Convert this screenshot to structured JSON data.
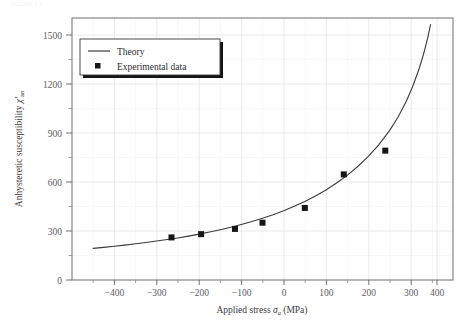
{
  "figure": {
    "caption": "FIGURE 1.1",
    "background": "#ffffff"
  },
  "chart_data": {
    "type": "line",
    "title": "",
    "xlabel": "Applied stress σa (MPa)",
    "xlabel_parts": {
      "text": "Applied stress ",
      "symbol": "σ",
      "subscript": "a",
      "units": " (MPa)"
    },
    "ylabel": "Anhysteretic susceptibility χ'an",
    "ylabel_parts": {
      "text": "Anhysteretic susceptibility ",
      "symbol": "χ′",
      "subscript": "an"
    },
    "xlim": [
      -450,
      450
    ],
    "ylim": [
      0,
      1600
    ],
    "xticks": [
      -400,
      -300,
      -200,
      -100,
      0,
      100,
      200,
      300,
      400
    ],
    "xticklabels": [
      "−400",
      "−300",
      "−200",
      "−100",
      "0",
      "100",
      "200",
      "300",
      "400"
    ],
    "yticks": [
      0,
      300,
      600,
      900,
      1200,
      1500
    ],
    "yticklabels": [
      "0",
      "300",
      "600",
      "900",
      "1200",
      "1500"
    ],
    "x_minor_step": 50,
    "y_minor_step": 150,
    "grid": true,
    "grid_color": "#e9e9eb",
    "axis_color": "#6f6f73",
    "legend": {
      "position": "upper-left",
      "entries": [
        {
          "label": "Theory",
          "marker": "line",
          "color": "#2b2b2d"
        },
        {
          "label": "Experimental data",
          "marker": "square",
          "color": "#161616"
        }
      ]
    },
    "series": [
      {
        "name": "Theory",
        "type": "line",
        "color": "#3a3a3c",
        "x": [
          -400,
          -375,
          -350,
          -325,
          -300,
          -275,
          -250,
          -225,
          -200,
          -175,
          -150,
          -125,
          -100,
          -75,
          -50,
          -25,
          0,
          25,
          50,
          75,
          100,
          125,
          150,
          175,
          200,
          225,
          250,
          275,
          300,
          320,
          340,
          355,
          370,
          380,
          390,
          397
        ],
        "y": [
          193,
          199,
          206,
          213,
          221,
          229,
          238,
          247,
          257,
          268,
          280,
          293,
          307,
          322,
          339,
          357,
          377,
          399,
          423,
          450,
          480,
          513,
          550,
          592,
          639,
          693,
          755,
          827,
          912,
          994,
          1093,
          1183,
          1290,
          1375,
          1475,
          1560
        ]
      },
      {
        "name": "Experimental data",
        "type": "scatter",
        "marker": "square",
        "color": "#161616",
        "x": [
          -215,
          -145,
          -65,
          0,
          100,
          192,
          290
        ],
        "y": [
          260,
          280,
          312,
          350,
          440,
          645,
          790
        ]
      }
    ]
  }
}
